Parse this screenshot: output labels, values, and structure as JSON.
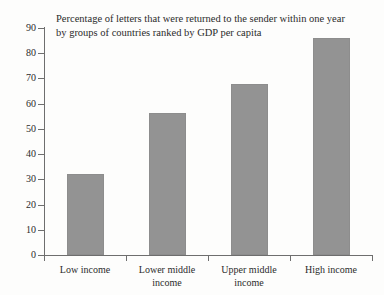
{
  "chart_data": {
    "type": "bar",
    "title": "Percentage of letters that were returned to the sender within one year\nby groups of countries ranked by GDP per capita",
    "title_line_1": "Percentage of letters that were returned to the sender within one year",
    "title_line_2": "by groups of countries ranked by GDP per capita",
    "categories": [
      "Low income",
      "Lower middle income",
      "Upper middle income",
      "High income"
    ],
    "values": [
      32,
      56.5,
      68,
      86
    ],
    "xlabel": "",
    "ylabel": "",
    "ylim": [
      0,
      90
    ],
    "ytick_interval": 10,
    "yticks": [
      0,
      10,
      20,
      30,
      40,
      50,
      60,
      70,
      80,
      90
    ],
    "ytick_labels": [
      "0",
      "10",
      "20",
      "30",
      "40",
      "50",
      "60",
      "70",
      "80",
      "90"
    ],
    "grid": false,
    "legend": false,
    "bar_color": "#939393",
    "axis_color": "#6e6e6e",
    "background_color": "#fdfdfc",
    "series": [
      {
        "name": "Percentage of letters returned",
        "values": [
          32,
          56.5,
          68,
          86
        ]
      }
    ]
  },
  "category_label_lines": [
    [
      "Low income"
    ],
    [
      "Lower middle",
      "income"
    ],
    [
      "Upper middle",
      "income"
    ],
    [
      "High income"
    ]
  ]
}
